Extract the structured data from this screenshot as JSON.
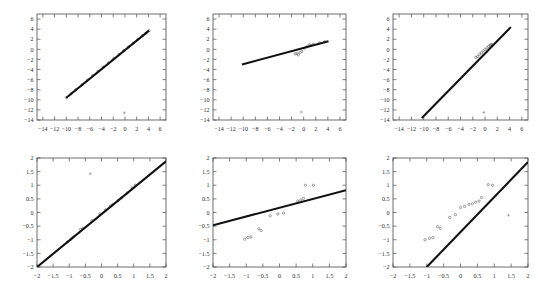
{
  "figure": {
    "kind": "scatter-with-regression-line-grid",
    "rows": 2,
    "cols": 3,
    "background": "#ffffff",
    "line_color": "#101010",
    "point_color": "#555555",
    "axis_color": "#4a4a4a"
  },
  "chart_data": [
    {
      "type": "scatter",
      "panel": "top-left",
      "title": "",
      "xlabel": "",
      "ylabel": "",
      "xlim": [
        -15,
        7
      ],
      "ylim": [
        -14,
        7
      ],
      "xticks": [
        -14,
        -12,
        -10,
        -8,
        -6,
        -4,
        -2,
        0,
        2,
        4,
        6
      ],
      "yticks": [
        6,
        4,
        2,
        0,
        -2,
        -4,
        -6,
        -8,
        -10,
        -12,
        -14
      ],
      "xticklabels": [
        "-14",
        "-12",
        "-10",
        "-8",
        "-6",
        "-4",
        "-2",
        "0",
        "2",
        "4",
        "6"
      ],
      "yticklabels": [
        "6",
        "4",
        "2",
        "0",
        "-2",
        "-4",
        "-6",
        "-8",
        "-10",
        "-12",
        "-14"
      ],
      "grid": false,
      "legend": null,
      "fit_line": {
        "x": [
          -10.0,
          4.1
        ],
        "y": [
          -9.6,
          3.7
        ],
        "slope": 0.943,
        "intercept": -0.17
      },
      "points": [
        {
          "x": -10.0,
          "y": -9.6
        },
        {
          "x": -9.2,
          "y": -8.8
        },
        {
          "x": -8.4,
          "y": -8.0
        },
        {
          "x": -7.3,
          "y": -7.0
        },
        {
          "x": -6.4,
          "y": -6.1
        },
        {
          "x": -5.5,
          "y": -5.2
        },
        {
          "x": -4.6,
          "y": -4.4
        },
        {
          "x": -3.7,
          "y": -3.5
        },
        {
          "x": -2.8,
          "y": -2.7
        },
        {
          "x": -1.9,
          "y": -1.8
        },
        {
          "x": -1.0,
          "y": -1.0
        },
        {
          "x": -0.2,
          "y": -0.2
        },
        {
          "x": 0.6,
          "y": 0.5
        },
        {
          "x": 1.4,
          "y": 1.2
        },
        {
          "x": 2.2,
          "y": 2.0
        },
        {
          "x": 3.0,
          "y": 2.7
        },
        {
          "x": 3.6,
          "y": 3.2
        },
        {
          "x": 4.1,
          "y": 3.7
        }
      ],
      "outliers": [
        {
          "x": -0.1,
          "y": -12.6
        }
      ]
    },
    {
      "type": "scatter",
      "panel": "top-center",
      "title": "",
      "xlabel": "",
      "ylabel": "",
      "xlim": [
        -15,
        7
      ],
      "ylim": [
        -14,
        7
      ],
      "xticks": [
        -14,
        -12,
        -10,
        -8,
        -6,
        -4,
        -2,
        0,
        2,
        4,
        6
      ],
      "yticks": [
        6,
        4,
        2,
        0,
        -2,
        -4,
        -6,
        -8,
        -10,
        -12,
        -14
      ],
      "xticklabels": [
        "-14",
        "-12",
        "-10",
        "-8",
        "-6",
        "-4",
        "-2",
        "0",
        "2",
        "4",
        "6"
      ],
      "yticklabels": [
        "6",
        "4",
        "2",
        "0",
        "-2",
        "-4",
        "-6",
        "-8",
        "-10",
        "-12",
        "-14"
      ],
      "grid": false,
      "legend": null,
      "fit_line": {
        "x": [
          -10.2,
          4.1
        ],
        "y": [
          -3.0,
          1.6
        ],
        "slope": 0.322,
        "intercept": 0.28
      },
      "points": [
        {
          "x": -1.4,
          "y": -0.9
        },
        {
          "x": -1.1,
          "y": -0.8
        },
        {
          "x": -0.9,
          "y": -1.1
        },
        {
          "x": -0.6,
          "y": -0.6
        },
        {
          "x": -0.3,
          "y": -0.4
        },
        {
          "x": 0.1,
          "y": 0.2
        },
        {
          "x": 0.5,
          "y": 0.5
        },
        {
          "x": 0.9,
          "y": 0.9
        },
        {
          "x": 1.2,
          "y": 0.8
        },
        {
          "x": 1.6,
          "y": 1.0
        },
        {
          "x": 2.6,
          "y": 1.3
        },
        {
          "x": 3.5,
          "y": 1.5
        }
      ],
      "outliers": [
        {
          "x": -0.4,
          "y": -12.4
        }
      ]
    },
    {
      "type": "scatter",
      "panel": "top-right",
      "title": "",
      "xlabel": "",
      "ylabel": "",
      "xlim": [
        -15,
        7
      ],
      "ylim": [
        -14,
        7
      ],
      "xticks": [
        -14,
        -12,
        -10,
        -8,
        -6,
        -4,
        -2,
        0,
        2,
        4,
        6
      ],
      "yticks": [
        6,
        4,
        2,
        0,
        -2,
        -4,
        -6,
        -8,
        -10,
        -12,
        -14
      ],
      "xticklabels": [
        "-14",
        "-12",
        "-10",
        "-8",
        "-6",
        "-4",
        "-2",
        "0",
        "2",
        "4",
        "6"
      ],
      "yticklabels": [
        "6",
        "4",
        "2",
        "0",
        "-2",
        "-4",
        "-6",
        "-8",
        "-10",
        "-12",
        "-14"
      ],
      "grid": false,
      "legend": null,
      "fit_line": {
        "x": [
          -10.3,
          4.2
        ],
        "y": [
          -13.6,
          4.4
        ],
        "slope": 1.241,
        "intercept": -0.82
      },
      "points": [
        {
          "x": -1.5,
          "y": -1.6
        },
        {
          "x": -1.2,
          "y": -1.4
        },
        {
          "x": -0.9,
          "y": -1.0
        },
        {
          "x": -0.6,
          "y": -0.7
        },
        {
          "x": -0.3,
          "y": -0.3
        },
        {
          "x": 0.0,
          "y": 0.0
        },
        {
          "x": 0.3,
          "y": 0.3
        },
        {
          "x": 0.6,
          "y": 0.6
        },
        {
          "x": 0.8,
          "y": 0.8
        },
        {
          "x": 1.0,
          "y": 1.0
        },
        {
          "x": 1.2,
          "y": 0.9
        }
      ],
      "outliers": [
        {
          "x": -0.2,
          "y": -12.5
        }
      ]
    },
    {
      "type": "scatter",
      "panel": "bottom-left",
      "title": "",
      "xlabel": "",
      "ylabel": "",
      "xlim": [
        -2,
        2
      ],
      "ylim": [
        -2,
        2
      ],
      "xticks": [
        -2,
        -1.5,
        -1,
        -0.5,
        0,
        0.5,
        1,
        1.5,
        2
      ],
      "yticks": [
        2,
        1.5,
        1,
        0.5,
        0,
        -0.5,
        -1,
        -1.5,
        -2
      ],
      "xticklabels": [
        "-2",
        "-1.5",
        "-1",
        "-0.5",
        "0",
        "0.5",
        "1",
        "1.5",
        "2"
      ],
      "yticklabels": [
        "2",
        "1.5",
        "1",
        "0.5",
        "0",
        "-0.5",
        "-1",
        "-1.5",
        "-2"
      ],
      "grid": false,
      "legend": null,
      "fit_line": {
        "x": [
          -2.0,
          2.0
        ],
        "y": [
          -2.0,
          1.88
        ],
        "slope": 0.97,
        "intercept": -0.06
      },
      "points": [
        {
          "x": -1.05,
          "y": -1.08
        },
        {
          "x": -0.95,
          "y": -0.98
        },
        {
          "x": -0.88,
          "y": -0.9
        },
        {
          "x": -0.65,
          "y": -0.62
        },
        {
          "x": -0.58,
          "y": -0.58
        },
        {
          "x": -0.3,
          "y": -0.3
        },
        {
          "x": -0.05,
          "y": -0.05
        },
        {
          "x": 0.12,
          "y": 0.1
        },
        {
          "x": 0.28,
          "y": 0.24
        },
        {
          "x": 0.35,
          "y": 0.3
        },
        {
          "x": 0.52,
          "y": 0.45
        },
        {
          "x": 0.62,
          "y": 0.54
        },
        {
          "x": 0.8,
          "y": 0.72
        },
        {
          "x": 0.95,
          "y": 0.9
        },
        {
          "x": 1.05,
          "y": 1.0
        }
      ],
      "outliers": [
        {
          "x": -0.35,
          "y": 1.42
        }
      ]
    },
    {
      "type": "scatter",
      "panel": "bottom-center",
      "title": "",
      "xlabel": "",
      "ylabel": "",
      "xlim": [
        -2,
        2
      ],
      "ylim": [
        -2,
        2
      ],
      "xticks": [
        -2,
        -1.5,
        -1,
        -0.5,
        0,
        0.5,
        1,
        1.5,
        2
      ],
      "yticks": [
        2,
        1.5,
        1,
        0.5,
        0,
        -0.5,
        -1,
        -1.5,
        -2
      ],
      "xticklabels": [
        "-2",
        "-1.5",
        "-1",
        "-0.5",
        "0",
        "0.5",
        "1",
        "1.5",
        "2"
      ],
      "yticklabels": [
        "2",
        "1.5",
        "1",
        "0.5",
        "0",
        "-0.5",
        "-1",
        "-1.5",
        "-2"
      ],
      "grid": false,
      "legend": null,
      "fit_line": {
        "x": [
          -2.0,
          2.0
        ],
        "y": [
          -0.47,
          0.82
        ],
        "slope": 0.3225,
        "intercept": 0.175
      },
      "points": [
        {
          "x": -1.05,
          "y": -0.98
        },
        {
          "x": -0.95,
          "y": -0.92
        },
        {
          "x": -0.86,
          "y": -0.9
        },
        {
          "x": -0.62,
          "y": -0.6
        },
        {
          "x": -0.55,
          "y": -0.66
        },
        {
          "x": -0.28,
          "y": -0.12
        },
        {
          "x": -0.05,
          "y": -0.05
        },
        {
          "x": 0.12,
          "y": -0.02
        },
        {
          "x": 0.55,
          "y": 0.42
        },
        {
          "x": 0.64,
          "y": 0.46
        },
        {
          "x": 0.72,
          "y": 0.52
        },
        {
          "x": 0.78,
          "y": 1.0
        },
        {
          "x": 1.02,
          "y": 1.0
        }
      ],
      "outliers": []
    },
    {
      "type": "scatter",
      "panel": "bottom-right",
      "title": "",
      "xlabel": "",
      "ylabel": "",
      "xlim": [
        -2,
        2
      ],
      "ylim": [
        -2,
        2
      ],
      "xticks": [
        -2,
        -1.5,
        -1,
        -0.5,
        0,
        0.5,
        1,
        1.5,
        2
      ],
      "yticks": [
        2,
        1.5,
        1,
        0.5,
        0,
        -0.5,
        -1,
        -1.5,
        -2
      ],
      "xticklabels": [
        "-2",
        "-1.5",
        "-1",
        "-0.5",
        "0",
        "0.5",
        "1",
        "1.5",
        "2"
      ],
      "yticklabels": [
        "2",
        "1.5",
        "1",
        "0.5",
        "0",
        "-0.5",
        "-1",
        "-1.5",
        "-2"
      ],
      "grid": false,
      "legend": null,
      "fit_line": {
        "x": [
          -1.0,
          2.0
        ],
        "y": [
          -2.0,
          1.85
        ],
        "slope": 1.283,
        "intercept": -0.717
      },
      "points": [
        {
          "x": -1.05,
          "y": -1.0
        },
        {
          "x": -0.92,
          "y": -0.95
        },
        {
          "x": -0.82,
          "y": -0.92
        },
        {
          "x": -0.68,
          "y": -0.52
        },
        {
          "x": -0.6,
          "y": -0.58
        },
        {
          "x": -0.32,
          "y": -0.18
        },
        {
          "x": -0.15,
          "y": -0.08
        },
        {
          "x": 0.0,
          "y": 0.18
        },
        {
          "x": 0.12,
          "y": 0.22
        },
        {
          "x": 0.25,
          "y": 0.3
        },
        {
          "x": 0.35,
          "y": 0.32
        },
        {
          "x": 0.45,
          "y": 0.38
        },
        {
          "x": 0.55,
          "y": 0.42
        },
        {
          "x": 0.62,
          "y": 0.55
        },
        {
          "x": 0.82,
          "y": 1.02
        },
        {
          "x": 0.95,
          "y": 1.0
        }
      ],
      "outliers": [
        {
          "x": 1.42,
          "y": -0.1
        }
      ]
    }
  ]
}
